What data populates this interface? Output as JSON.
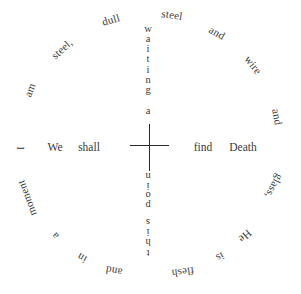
{
  "poem": {
    "ring_words": [
      {
        "text": "I",
        "x": 20,
        "y": 148,
        "rot": -90
      },
      {
        "text": "am",
        "x": 30,
        "y": 90,
        "rot": -68
      },
      {
        "text": "steel,",
        "x": 62,
        "y": 49,
        "rot": -42
      },
      {
        "text": "dull",
        "x": 111,
        "y": 20,
        "rot": -16
      },
      {
        "text": "steel",
        "x": 172,
        "y": 15,
        "rot": 8
      },
      {
        "text": "and",
        "x": 217,
        "y": 33,
        "rot": 30
      },
      {
        "text": "wire",
        "x": 253,
        "y": 65,
        "rot": 52
      },
      {
        "text": "and",
        "x": 277,
        "y": 117,
        "rot": 80
      },
      {
        "text": "glass,",
        "x": 274,
        "y": 186,
        "rot": 118
      },
      {
        "text": "He",
        "x": 245,
        "y": 236,
        "rot": 138
      },
      {
        "text": "is",
        "x": 220,
        "y": 257,
        "rot": 152
      },
      {
        "text": "flesh",
        "x": 183,
        "y": 272,
        "rot": 172
      },
      {
        "text": "and",
        "x": 114,
        "y": 271,
        "rot": 190
      },
      {
        "text": "in",
        "x": 82,
        "y": 258,
        "rot": 210
      },
      {
        "text": "a",
        "x": 55,
        "y": 236,
        "rot": 228
      },
      {
        "text": "moment",
        "x": 27,
        "y": 198,
        "rot": 250
      }
    ],
    "center_words": [
      {
        "text": "We",
        "x": 55,
        "y": 147
      },
      {
        "text": "shall",
        "x": 89,
        "y": 147
      },
      {
        "text": "find",
        "x": 203,
        "y": 147
      },
      {
        "text": "Death",
        "x": 243,
        "y": 147
      }
    ],
    "vertical_top": {
      "word1": "waiting",
      "word2": "a",
      "chars": [
        {
          "c": "w",
          "y": 29
        },
        {
          "c": "a",
          "y": 39
        },
        {
          "c": "i",
          "y": 49
        },
        {
          "c": "t",
          "y": 59
        },
        {
          "c": "i",
          "y": 70
        },
        {
          "c": "n",
          "y": 80
        },
        {
          "c": "g",
          "y": 90
        },
        {
          "c": "a",
          "y": 111
        }
      ],
      "x": 148
    },
    "vertical_bottom": {
      "word1": "point",
      "word2": "this",
      "chars_flipped": [
        {
          "c": "t",
          "y": 177
        },
        {
          "c": "n",
          "y": 172
        },
        {
          "c": "i",
          "y": 184
        },
        {
          "c": "o",
          "y": 193
        },
        {
          "c": "p",
          "y": 203
        },
        {
          "c": "s",
          "y": 222
        },
        {
          "c": "i",
          "y": 231
        },
        {
          "c": "h",
          "y": 241
        },
        {
          "c": "t",
          "y": 253
        }
      ],
      "x": 148
    }
  }
}
